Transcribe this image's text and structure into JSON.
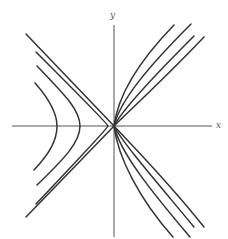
{
  "figure": {
    "axes": {
      "x_label": "x",
      "y_label": "y",
      "origin_px": [
        114,
        126
      ],
      "x_axis_px": [
        12,
        212
      ],
      "y_axis_px": [
        25,
        237
      ]
    },
    "colors": {
      "curve": "#333333",
      "axis": "#555555",
      "background": "#ffffff"
    },
    "curves": {
      "left": [
        {
          "name": "asymptote-outer",
          "path": "M26,34 L114,126 L26,217"
        },
        {
          "name": "near-asymptote",
          "path": "M36,52 Q108,124 108,126 Q108,128 36,204"
        },
        {
          "name": "hyperbola-mid",
          "path": "M37,66 C65,95 80,110 80,126 C80,142 65,158 37,185"
        },
        {
          "name": "hyperbola-inner",
          "path": "M35,83 C50,100 57,113 57,126 C57,140 50,153 34,170"
        }
      ],
      "right": [
        {
          "name": "right-1",
          "path": "M114,126 C118,95 140,60 174,25"
        },
        {
          "name": "right-2",
          "path": "M114,126 C120,100 150,65 191,24"
        },
        {
          "name": "right-3",
          "path": "M114,126 C122,110 155,75 194,36"
        },
        {
          "name": "right-4",
          "path": "M114,126 C125,115 165,78 204,37"
        },
        {
          "name": "right-5",
          "path": "M114,126 C118,158 140,200 173,237"
        },
        {
          "name": "right-6",
          "path": "M114,126 C120,152 150,190 190,237"
        },
        {
          "name": "right-7",
          "path": "M114,126 C122,142 155,180 194,227"
        },
        {
          "name": "right-8",
          "path": "M114,126 C125,138 165,178 204,227"
        }
      ]
    }
  }
}
